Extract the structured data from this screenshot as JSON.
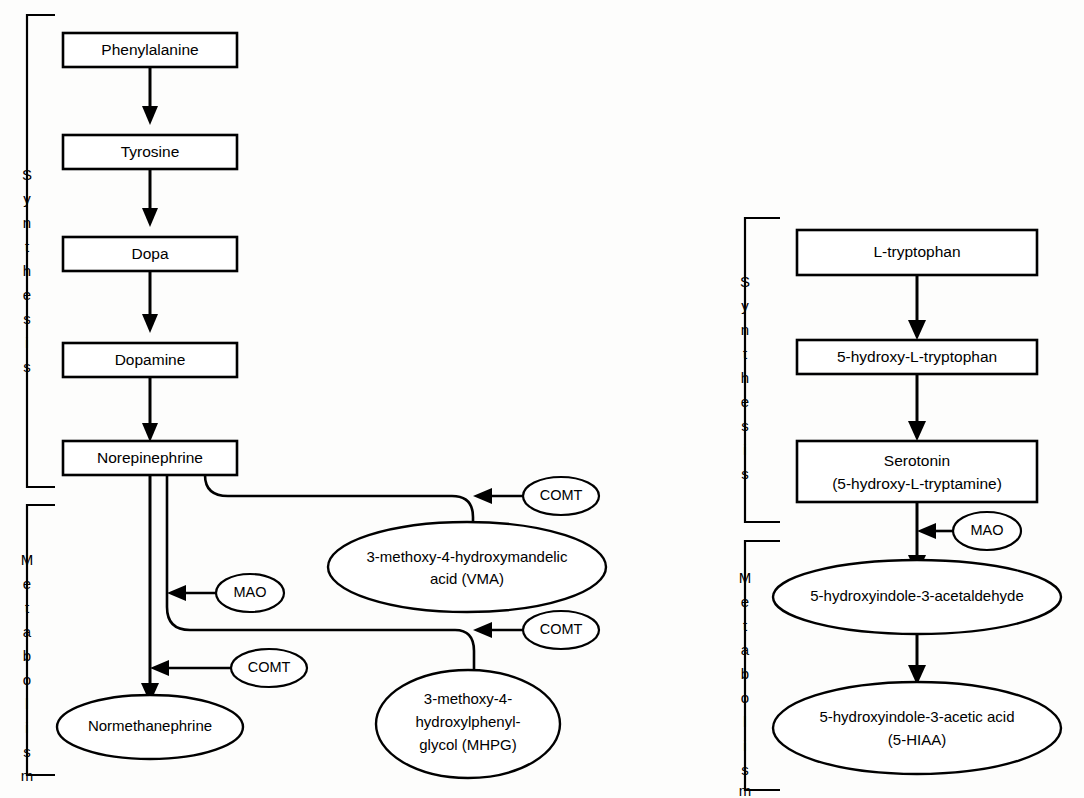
{
  "figure": {
    "background_color": "#fdfdfc",
    "line_color": "#000000",
    "type": "biochemical-pathway-diagram"
  },
  "pathways": {
    "catecholamine": {
      "brackets": {
        "synthesis": "Synthesis",
        "metabolism": "Metabolism"
      },
      "synthesis_nodes": [
        {
          "id": "phenylalanine",
          "label": "Phenylalanine",
          "shape": "rect"
        },
        {
          "id": "tyrosine",
          "label": "Tyrosine",
          "shape": "rect"
        },
        {
          "id": "dopa",
          "label": "Dopa",
          "shape": "rect"
        },
        {
          "id": "dopamine",
          "label": "Dopamine",
          "shape": "rect"
        },
        {
          "id": "norepinephrine",
          "label": "Norepinephrine",
          "shape": "rect"
        }
      ],
      "metabolite_nodes": [
        {
          "id": "vma",
          "shape": "ellipse",
          "line1": "3-methoxy-4-hydroxymandelic",
          "line2": "acid (VMA)"
        },
        {
          "id": "mhpg",
          "shape": "ellipse",
          "line1": "3-methoxy-4-",
          "line2": "hydroxylphenyl-",
          "line3": "glycol (MHPG)"
        },
        {
          "id": "normetanephrine",
          "shape": "ellipse",
          "line1": "Normethanephrine"
        }
      ],
      "enzymes": [
        {
          "id": "comt-vma",
          "label": "COMT",
          "target": "vma"
        },
        {
          "id": "mao-left",
          "label": "MAO",
          "target": "mhpg"
        },
        {
          "id": "comt-mhpg",
          "label": "COMT",
          "target": "mhpg"
        },
        {
          "id": "comt-nmn",
          "label": "COMT",
          "target": "normetanephrine"
        }
      ]
    },
    "serotonin": {
      "brackets": {
        "synthesis": "Synthesis",
        "metabolism": "Metabolism"
      },
      "synthesis_nodes": [
        {
          "id": "l-tryptophan",
          "label": "L-tryptophan",
          "shape": "rect"
        },
        {
          "id": "5-hydroxy-l-tryptophan",
          "label": "5-hydroxy-L-tryptophan",
          "shape": "rect"
        },
        {
          "id": "serotonin",
          "shape": "rect",
          "line1": "Serotonin",
          "line2": "(5-hydroxy-L-tryptamine)"
        }
      ],
      "metabolite_nodes": [
        {
          "id": "5-hydroxyindole-3-acetaldehyde",
          "shape": "ellipse",
          "line1": "5-hydroxyindole-3-acetaldehyde"
        },
        {
          "id": "5-hiaa",
          "shape": "ellipse",
          "line1": "5-hydroxyindole-3-acetic acid",
          "line2": "(5-HIAA)"
        }
      ],
      "enzymes": [
        {
          "id": "mao-right",
          "label": "MAO",
          "target": "5-hydroxyindole-3-acetaldehyde"
        }
      ]
    }
  }
}
